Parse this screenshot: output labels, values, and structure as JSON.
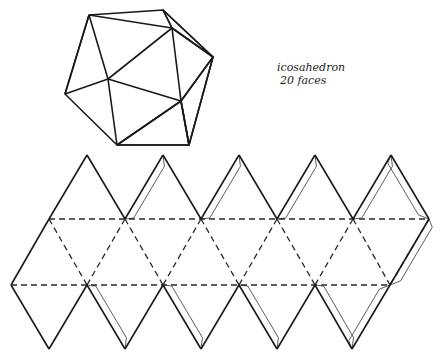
{
  "caption": {
    "title": "icosahedron",
    "subtitle": "20 faces"
  },
  "solid_figure": {
    "name": "icosahedron-3d-view",
    "vertices": {
      "top_left": [
        89,
        15
      ],
      "top_right": [
        163,
        10
      ],
      "inner_top": [
        172,
        28
      ],
      "right": [
        213,
        57
      ],
      "center": [
        108,
        79
      ],
      "left": [
        65,
        94
      ],
      "inner_low": [
        181,
        101
      ],
      "bottom_left": [
        117,
        145
      ],
      "bottom_right": [
        189,
        145
      ]
    },
    "shaded_faces": 3
  },
  "net": {
    "name": "icosahedron-net",
    "triangle_side": 76,
    "top_apexes_x": [
      87,
      163,
      239,
      315,
      391
    ],
    "top_apex_y": 155,
    "upper_fold_y": 219,
    "upper_fold_x": [
      49,
      125,
      201,
      277,
      353,
      429
    ],
    "lower_fold_y": 285,
    "lower_fold_x": [
      11,
      87,
      163,
      239,
      315,
      390
    ],
    "bottom_apexes_x": [
      49,
      125,
      201,
      277,
      352
    ],
    "bottom_apex_y": 349,
    "fold_line_style": "dashed",
    "cut_line_style": "solid",
    "glue_tabs": "thin outline"
  },
  "colors": {
    "ink": "#1a1a1a",
    "paper": "#ffffff"
  }
}
